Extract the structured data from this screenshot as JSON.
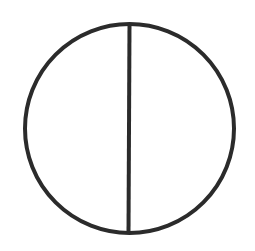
{
  "diagram": {
    "type": "circle-bisected-vertically",
    "stroke_color": "#2b2b2b",
    "background_color": "#ffffff",
    "circle": {
      "cx": 129.5,
      "cy": 128.5,
      "r": 104.5,
      "stroke_width": 4
    },
    "diameter": {
      "x1": 129.5,
      "y1": 24,
      "x2": 128.5,
      "y2": 233,
      "stroke_width": 4
    }
  }
}
